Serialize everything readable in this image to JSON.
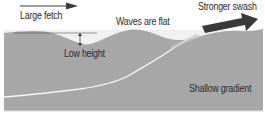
{
  "diagram": {
    "type": "beach-wave-diagram",
    "labels": {
      "large_fetch": "Large fetch",
      "waves_flat": "Waves are flat",
      "stronger_swash": "Stronger swash",
      "low_height": "Low height",
      "shallow_gradient": "Shallow gradient"
    },
    "icons": {
      "fetch_arrow": "thin-right-arrow",
      "swash_arrow": "bold-right-arrow",
      "height_marker": "double-headed-vertical-arrow"
    },
    "colors": {
      "water": "#a9a9a9",
      "seabed_line": "#f2f2f2",
      "arrow": "#3a3a3a",
      "text": "#2a2a2a",
      "background": "#ffffff"
    }
  }
}
